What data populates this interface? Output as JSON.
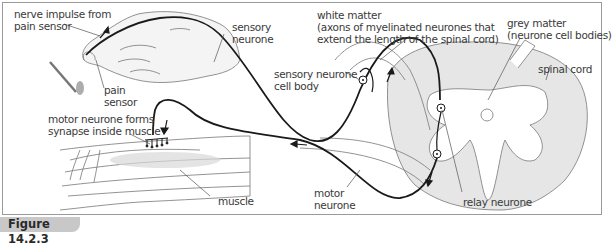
{
  "figure": {
    "caption": "Figure 14.2.3"
  },
  "labels": {
    "nerve_impulse_line1": "nerve impulse from",
    "nerve_impulse_line2": "pain sensor",
    "pain_sensor_line1": "pain",
    "pain_sensor_line2": "sensor",
    "sensory_neurone_line1": "sensory",
    "sensory_neurone_line2": "neurone",
    "white_matter_line1": "white matter",
    "white_matter_line2": "(axons of myelinated neurones that",
    "white_matter_line3": "extend the length of the spinal cord)",
    "grey_matter_line1": "grey matter",
    "grey_matter_line2": "(neurone cell bodies)",
    "spinal_cord": "spinal cord",
    "sensory_cell_body_line1": "sensory neurone",
    "sensory_cell_body_line2": "cell body",
    "motor_synapse_line1": "motor neurone forms",
    "motor_synapse_line2": "synapse inside muscle",
    "muscle": "muscle",
    "motor_neurone_line1": "motor",
    "motor_neurone_line2": "neurone",
    "relay_neurone": "relay neurone"
  },
  "colors": {
    "grey_matter": "#d9d9d9",
    "neurone_line": "#1a1a1a",
    "outline": "#6e6e6e",
    "caption_tab": "#c8c8c8"
  }
}
